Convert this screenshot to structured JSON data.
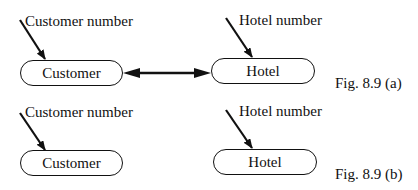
{
  "figures": [
    {
      "caption": "Fig. 8.9 (a)",
      "entities": [
        {
          "name": "Customer",
          "attribute": "Customer number"
        },
        {
          "name": "Hotel",
          "attribute": "Hotel number"
        }
      ],
      "relationship": "bidirectional arrow between Customer and Hotel"
    },
    {
      "caption": "Fig. 8.9 (b)",
      "entities": [
        {
          "name": "Customer",
          "attribute": "Customer number"
        },
        {
          "name": "Hotel",
          "attribute": "Hotel number"
        }
      ],
      "relationship": "none"
    }
  ],
  "colors": {
    "stroke": "#111111",
    "background": "#ffffff"
  }
}
